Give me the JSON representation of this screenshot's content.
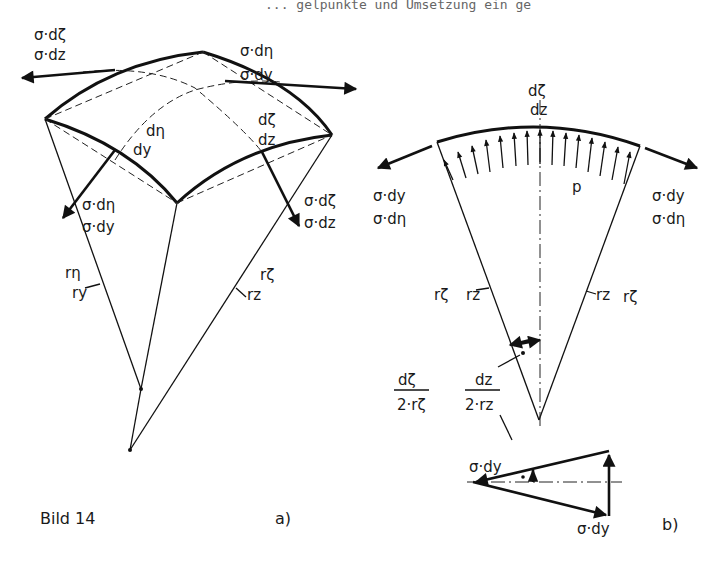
{
  "header_fragment": "... gelpunkte und Umsetzung ein ge",
  "figure": {
    "caption": "Bild 14",
    "panel_a_label": "a)",
    "panel_b_label": "b)"
  },
  "panel_a": {
    "force_top_left": [
      "σ·dζ",
      "σ·dz"
    ],
    "force_top_right": [
      "σ·dη",
      "σ·dy"
    ],
    "edge_left": [
      "dη",
      "dy"
    ],
    "edge_right": [
      "dζ",
      "dz"
    ],
    "force_bottom_left": [
      "σ·dη",
      "σ·dy"
    ],
    "force_bottom_right": [
      "σ·dζ",
      "σ·dz"
    ],
    "radius_left": [
      "rη",
      "ry"
    ],
    "radius_right": [
      "rζ",
      "rz"
    ]
  },
  "panel_b": {
    "arc_label": [
      "dζ",
      "dz"
    ],
    "pressure_label": "p",
    "force_left": [
      "σ·dy",
      "σ·dη"
    ],
    "force_right": [
      "σ·dy",
      "σ·dη"
    ],
    "radius_left": [
      "rζ",
      "rz"
    ],
    "radius_right": [
      "rz",
      "rζ"
    ],
    "angle_left": {
      "num": "dζ",
      "den": "2·rζ"
    },
    "angle_right": {
      "num": "dz",
      "den": "2·rz"
    },
    "triangle_top_label": "σ·dy",
    "triangle_bottom_label": "σ·dy"
  }
}
